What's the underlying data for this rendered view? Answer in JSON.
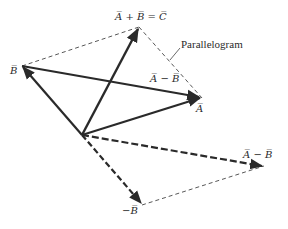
{
  "diagram": {
    "type": "vector-addition-subtraction",
    "colors": {
      "stroke": "#2a2a2a",
      "dashed": "#444444",
      "background": "#ffffff"
    },
    "points": {
      "origin": [
        82,
        135
      ],
      "A": [
        202,
        98
      ],
      "B": [
        22,
        66
      ],
      "C": [
        139,
        27
      ],
      "negB": [
        142,
        205
      ],
      "AminusB": [
        264,
        166
      ]
    },
    "labels": {
      "sum": "A̅ + B̅ = C̅",
      "parallelogram": "Parallelogram",
      "B": "B̅",
      "A": "A̅",
      "diff_top": "A̅ − B̅",
      "diff_right": "A̅ − B̅",
      "negB": "−B̅"
    }
  }
}
